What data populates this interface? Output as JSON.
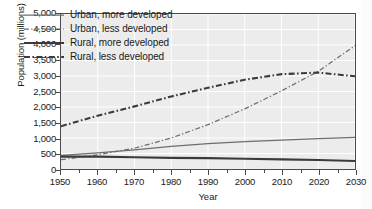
{
  "chart_data": {
    "type": "line",
    "title": "",
    "xlabel": "Year",
    "ylabel": "Population (millions)",
    "xlim": [
      1950,
      2030
    ],
    "ylim": [
      0,
      5000
    ],
    "xticks": [
      1950,
      1960,
      1970,
      1980,
      1990,
      2000,
      2010,
      2020,
      2030
    ],
    "xtick_labels": [
      "1950",
      "1960",
      "1970",
      "1980",
      "1990",
      "2000",
      "2010",
      "2020",
      "2030"
    ],
    "x_minor_tick_interval": 5,
    "yticks": [
      0,
      500,
      1000,
      1500,
      2000,
      2500,
      3000,
      3500,
      4000,
      4500,
      5000
    ],
    "ytick_labels": [
      "0",
      "500",
      "1,000",
      "1,500",
      "2,000",
      "2,500",
      "3,000",
      "3,500",
      "4,000",
      "4,500",
      "5,000"
    ],
    "grid": true,
    "grid_color": "#ffffff",
    "plot_background": "#ececec",
    "legend_position": "upper left",
    "x": [
      1950,
      1960,
      1970,
      1980,
      1990,
      2000,
      2010,
      2020,
      2030
    ],
    "series": [
      {
        "name": "Urban, more developed",
        "style": "solid",
        "width": "thin",
        "color": "#6e6e6e",
        "values": [
          440,
          520,
          620,
          730,
          820,
          880,
          930,
          980,
          1020
        ]
      },
      {
        "name": "Urban, less developed",
        "style": "dash-dot",
        "width": "thin",
        "color": "#6e6e6e",
        "values": [
          300,
          460,
          670,
          1000,
          1430,
          1940,
          2520,
          3150,
          3980
        ]
      },
      {
        "name": "Rural, more developed",
        "style": "solid",
        "width": "thick",
        "color": "#3b3b3b",
        "values": [
          400,
          400,
          380,
          360,
          350,
          330,
          310,
          290,
          260
        ]
      },
      {
        "name": "Rural, less developed",
        "style": "dash-dot",
        "width": "thick",
        "color": "#3b3b3b",
        "values": [
          1380,
          1720,
          2020,
          2340,
          2620,
          2880,
          3060,
          3110,
          2990
        ]
      }
    ]
  },
  "legend": {
    "items": [
      {
        "label": "Urban, more developed"
      },
      {
        "label": "Urban, less developed"
      },
      {
        "label": "Rural, more developed"
      },
      {
        "label": "Rural, less developed"
      }
    ]
  }
}
